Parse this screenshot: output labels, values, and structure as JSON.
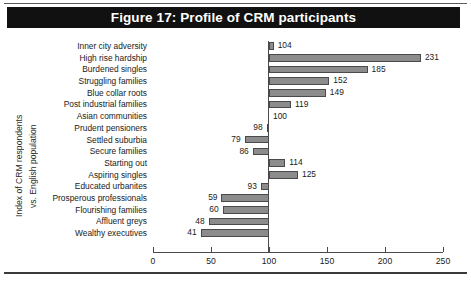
{
  "figure": {
    "title": "Figure 17: Profile of CRM participants",
    "banner_color": "#111111",
    "banner_text_color": "#ffffff"
  },
  "chart_data": {
    "type": "bar",
    "orientation": "horizontal",
    "title": "Figure 17: Profile of CRM participants",
    "xlabel": "",
    "ylabel": "Index of CRM respondents vs. English population",
    "ylabel_line1": "Index of CRM respondents",
    "ylabel_line2": "vs. English population",
    "baseline": 100,
    "xlim": [
      0,
      250
    ],
    "xticks": [
      0,
      50,
      100,
      150,
      200,
      250
    ],
    "xtick_labels": [
      "0",
      "50",
      "100",
      "150",
      "200",
      "250"
    ],
    "grid": false,
    "legend": false,
    "bar_color": "#8c8c8c",
    "bar_edge_color": "#4a4a4a",
    "categories": [
      "Inner city adversity",
      "High rise hardship",
      "Burdened singles",
      "Struggling families",
      "Blue collar roots",
      "Post industrial families",
      "Asian communities",
      "Prudent pensioners",
      "Settled suburbia",
      "Secure families",
      "Starting out",
      "Aspiring singles",
      "Educated urbanites",
      "Prosperous professionals",
      "Flourishing families",
      "Affluent greys",
      "Wealthy executives"
    ],
    "values": [
      104,
      231,
      185,
      152,
      149,
      119,
      100,
      98,
      79,
      86,
      114,
      125,
      93,
      59,
      60,
      48,
      41
    ],
    "value_labels": [
      "104",
      "231",
      "185",
      "152",
      "149",
      "119",
      "100",
      "98",
      "79",
      "86",
      "114",
      "125",
      "93",
      "59",
      "60",
      "48",
      "41"
    ]
  }
}
